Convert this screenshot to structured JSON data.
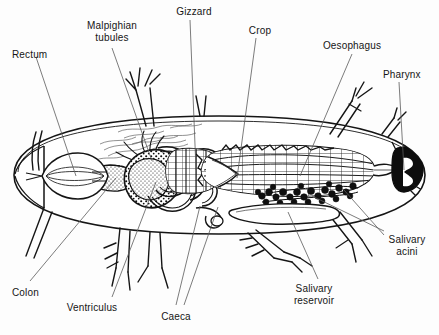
{
  "figure": {
    "background_color": "#fdfdfd",
    "ink_color": "#151515",
    "leader_color": "#555555",
    "width": 439,
    "height": 335
  },
  "labels": [
    {
      "id": "rectum",
      "text": "Rectum",
      "x": 12,
      "y": 49,
      "align": "lft",
      "lines": 1
    },
    {
      "id": "malpighian",
      "text": "Malpighian\ntubules",
      "x": 68,
      "y": 20,
      "align": "ctr",
      "lines": 2
    },
    {
      "id": "gizzard",
      "text": "Gizzard",
      "x": 168,
      "y": 6,
      "align": "ctr",
      "lines": 1
    },
    {
      "id": "crop",
      "text": "Crop",
      "x": 246,
      "y": 25,
      "align": "ctr",
      "lines": 1
    },
    {
      "id": "oesophagus",
      "text": "Oesophagus",
      "x": 320,
      "y": 40,
      "align": "ctr",
      "lines": 1
    },
    {
      "id": "pharynx",
      "text": "Pharynx",
      "x": 383,
      "y": 69,
      "align": "lft",
      "lines": 1
    },
    {
      "id": "salivary-acini",
      "text": "Salivary\nacini",
      "x": 387,
      "y": 234,
      "align": "ctr",
      "lines": 2
    },
    {
      "id": "salivary-reservoir",
      "text": "Salivary\nreservoir",
      "x": 308,
      "y": 283,
      "align": "ctr",
      "lines": 2
    },
    {
      "id": "caeca",
      "text": "Caeca",
      "x": 173,
      "y": 311,
      "align": "ctr",
      "lines": 1
    },
    {
      "id": "ventriculus",
      "text": "Ventriculus",
      "x": 86,
      "y": 302,
      "align": "ctr",
      "lines": 1
    },
    {
      "id": "colon",
      "text": "Colon",
      "x": 12,
      "y": 287,
      "align": "lft",
      "lines": 1
    }
  ],
  "anatomy_parts": [
    "rectum",
    "colon",
    "ventriculus",
    "caeca",
    "gizzard",
    "crop",
    "oesophagus",
    "pharynx",
    "malpighian-tubules",
    "salivary-reservoir",
    "salivary-acini"
  ]
}
